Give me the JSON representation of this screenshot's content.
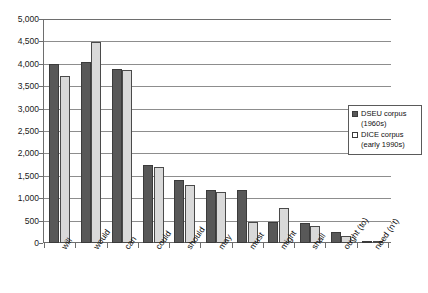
{
  "chart_data": {
    "type": "bar",
    "title": "",
    "xlabel": "",
    "ylabel": "",
    "ylim": [
      0,
      5000
    ],
    "ytick_step": 500,
    "grid": true,
    "legend_position": "right",
    "categories": [
      "will",
      "would",
      "can",
      "could",
      "should",
      "may",
      "must",
      "might",
      "shall",
      "ought (to)",
      "need (n't)"
    ],
    "ytick_labels": [
      "5,000",
      "4,500",
      "4,000",
      "3,500",
      "3,000",
      "2,500",
      "2,000",
      "1,500",
      "1,000",
      "500",
      "0"
    ],
    "ytick_values": [
      5000,
      4500,
      4000,
      3500,
      3000,
      2500,
      2000,
      1500,
      1000,
      500,
      0
    ],
    "series": [
      {
        "name": "DSEU corpus (1960s)",
        "name_line1": "DSEU corpus",
        "name_line2": "(1960s)",
        "color": "#585858",
        "values": [
          4000,
          4050,
          3880,
          1750,
          1400,
          1180,
          1180,
          480,
          440,
          250,
          40
        ]
      },
      {
        "name": "DICE corpus (early 1990s)",
        "name_line1": "DICE corpus",
        "name_line2": "(early 1990s)",
        "color": "#d9d9d9",
        "values": [
          3730,
          4490,
          3860,
          1700,
          1300,
          1140,
          460,
          790,
          390,
          150,
          25
        ]
      }
    ]
  },
  "colors": {
    "series_dark": "#585858",
    "series_light": "#d9d9d9",
    "axis": "#6e6e6e",
    "grid": "#8d8d8d",
    "text": "#111111",
    "background": "#ffffff"
  },
  "legend": {
    "entries": [
      {
        "line1": "DSEU corpus",
        "line2": "(1960s)"
      },
      {
        "line1": "DICE corpus",
        "line2": "(early 1990s)"
      }
    ]
  }
}
